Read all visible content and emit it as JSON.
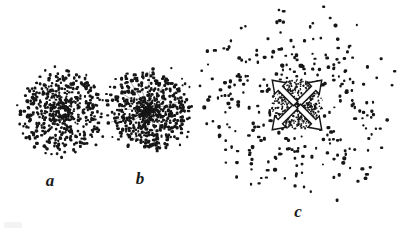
{
  "figure": {
    "caption": "",
    "background_color": "#ffffff",
    "ink_color": "#161616",
    "width": 403,
    "height": 231,
    "style": "vintage engraving stipple illustration"
  },
  "panels": [
    {
      "id": "a",
      "label": "a",
      "label_x": 50,
      "label_y": 172,
      "label_size": 17,
      "center_x": 62,
      "center_y": 112,
      "radius": 42,
      "dot_count": 620,
      "dot_min_size": 1.1,
      "dot_max_size": 2.4,
      "core_density": "uniform-dense",
      "has_radial_streaks": false,
      "has_arrows": false,
      "has_core_void": true,
      "core_void_radius": 3,
      "seed": 1207,
      "description": "round evenly dense stipple disc with small light void at center"
    },
    {
      "id": "b",
      "label": "b",
      "label_x": 140,
      "label_y": 170,
      "label_size": 17,
      "center_x": 148,
      "center_y": 110,
      "radius": 42,
      "dot_count": 640,
      "dot_min_size": 1.0,
      "dot_max_size": 2.5,
      "core_density": "center-concentrated",
      "has_radial_streaks": true,
      "streak_count": 16,
      "has_arrows": false,
      "has_core_void": false,
      "seed": 4451,
      "description": "disc with very dark concentrated nucleus and faint radial streaks"
    },
    {
      "id": "c",
      "label": "c",
      "label_x": 298,
      "label_y": 203,
      "label_size": 17,
      "center_x": 297,
      "center_y": 105,
      "radius": 92,
      "dot_count": 300,
      "dot_min_size": 1.7,
      "dot_max_size": 2.9,
      "core_density": "sparse-halo-with-dense-core",
      "has_radial_streaks": false,
      "has_arrows": true,
      "arrow_count": 4,
      "arrow_directions": [
        "up-right",
        "down-right",
        "down-left",
        "up-left"
      ],
      "arrow_length": 35,
      "arrow_fill": "#ffffff",
      "arrow_stroke": "#161616",
      "core_radius": 26,
      "core_dot_count": 520,
      "has_core_void": false,
      "seed": 8891,
      "description": "large sparse dot halo around dense core crossed by four white outward arrows"
    }
  ]
}
